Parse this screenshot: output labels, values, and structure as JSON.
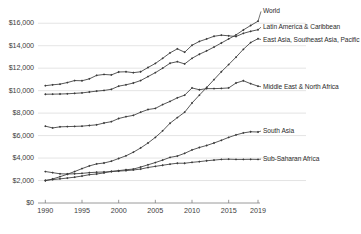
{
  "chart_data": {
    "type": "line",
    "title": "",
    "subtitle": "",
    "xlabel": "",
    "ylabel": "",
    "xlim": [
      1989,
      2019
    ],
    "ylim": [
      0,
      17000
    ],
    "grid": true,
    "grid_axis": "y",
    "legend_position": "inline-right-end-labels",
    "marker": "diamond",
    "line_color": "#3a3a3a",
    "grid_color": "#d9d9d9",
    "axis_color": "#808080",
    "text_color": "#3d3d3d",
    "x": [
      1990,
      1991,
      1992,
      1993,
      1994,
      1995,
      1996,
      1997,
      1998,
      1999,
      2000,
      2001,
      2002,
      2003,
      2004,
      2005,
      2006,
      2007,
      2008,
      2009,
      2010,
      2011,
      2012,
      2013,
      2014,
      2015,
      2016,
      2017,
      2018,
      2019
    ],
    "ytick_labels": [
      "$0",
      "$2,000",
      "$4,000",
      "$6,000",
      "$8,000",
      "$10,000",
      "$12,000",
      "$14,000",
      "$16,000"
    ],
    "ytick_values": [
      0,
      2000,
      4000,
      6000,
      8000,
      10000,
      12000,
      14000,
      16000
    ],
    "xtick_labels": [
      "1990",
      "1995",
      "2000",
      "2005",
      "2010",
      "2015",
      "2019"
    ],
    "xtick_values": [
      1990,
      1995,
      2000,
      2005,
      2010,
      2015,
      2019
    ],
    "series": [
      {
        "name": "World",
        "label": "World",
        "label_x": 2019,
        "label_y": 17050,
        "values": [
          9680,
          9690,
          9700,
          9720,
          9760,
          9800,
          9880,
          9960,
          10020,
          10120,
          10400,
          10520,
          10680,
          10900,
          11250,
          11600,
          12000,
          12440,
          12580,
          12380,
          12880,
          13240,
          13540,
          13880,
          14240,
          14600,
          14960,
          15400,
          15800,
          16180
        ]
      },
      {
        "name": "Latin America & Caribbean",
        "label": "Latin America & Caribbean",
        "label_x": 2019,
        "label_y": 15650,
        "values": [
          10440,
          10520,
          10580,
          10720,
          10900,
          10880,
          11050,
          11360,
          11440,
          11400,
          11660,
          11680,
          11600,
          11680,
          12060,
          12420,
          12880,
          13360,
          13720,
          13420,
          14040,
          14380,
          14600,
          14840,
          14940,
          14880,
          14820,
          15100,
          15280,
          15420
        ]
      },
      {
        "name": "East Asia, Southeast Asia, Pacific",
        "label": "East Asia, Southeast Asia, Pacific",
        "label_x": 2019,
        "label_y": 14550,
        "values": [
          1980,
          2140,
          2340,
          2560,
          2800,
          3060,
          3300,
          3480,
          3560,
          3720,
          3960,
          4200,
          4520,
          4900,
          5340,
          5840,
          6420,
          7100,
          7600,
          8080,
          8900,
          9600,
          10280,
          10980,
          11680,
          12320,
          12980,
          13680,
          14280,
          14620
        ]
      },
      {
        "name": "Middle East & North Africa",
        "label": "Middle East & North Africa",
        "label_x": 2019,
        "label_y": 10350,
        "values": [
          6840,
          6680,
          6780,
          6800,
          6820,
          6840,
          6900,
          6960,
          7120,
          7240,
          7520,
          7680,
          7800,
          8080,
          8320,
          8420,
          8760,
          9040,
          9360,
          9600,
          10240,
          10080,
          10180,
          10180,
          10200,
          10240,
          10680,
          10880,
          10620,
          10400
        ]
      },
      {
        "name": "South Asia",
        "label": "South Asia",
        "label_x": 2019,
        "label_y": 6400,
        "values": [
          2020,
          2080,
          2150,
          2220,
          2300,
          2400,
          2520,
          2580,
          2680,
          2820,
          2880,
          2960,
          3020,
          3200,
          3400,
          3600,
          3820,
          4060,
          4180,
          4420,
          4720,
          4940,
          5120,
          5340,
          5580,
          5840,
          6060,
          6240,
          6340,
          6320
        ]
      },
      {
        "name": "Sub-Saharan Africa",
        "label": "Sub-Saharan Africa",
        "label_x": 2019,
        "label_y": 3900,
        "values": [
          2800,
          2700,
          2600,
          2580,
          2600,
          2640,
          2700,
          2740,
          2760,
          2790,
          2840,
          2880,
          2940,
          3020,
          3160,
          3260,
          3360,
          3460,
          3540,
          3540,
          3620,
          3680,
          3760,
          3820,
          3880,
          3900,
          3880,
          3880,
          3890,
          3880
        ]
      }
    ]
  },
  "plot": {
    "left": 38,
    "right": 258,
    "top": 12,
    "bottom": 203
  }
}
